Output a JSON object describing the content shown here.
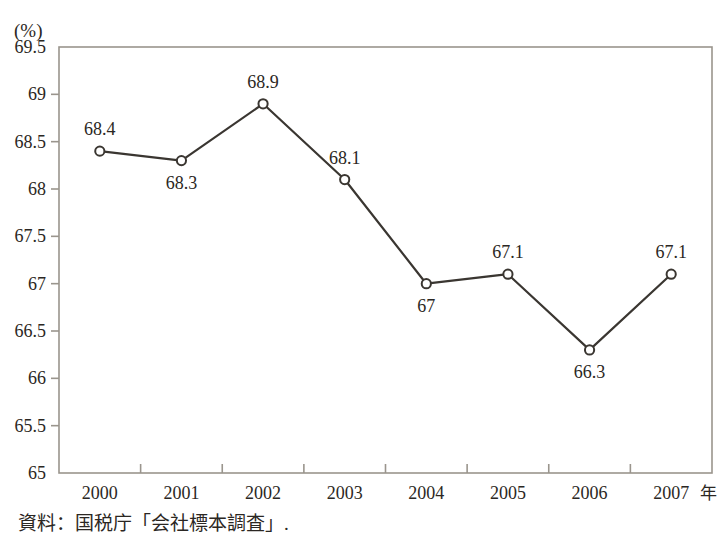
{
  "figure": {
    "unit_label": "(%)",
    "caption": "資料：国税庁「会社標本調査」.",
    "x_axis_unit": "年"
  },
  "chart_data": {
    "type": "line",
    "title": "",
    "xlabel": "",
    "ylabel": "(%)",
    "categories": [
      "2000",
      "2001",
      "2002",
      "2003",
      "2004",
      "2005",
      "2006",
      "2007"
    ],
    "values": [
      68.4,
      68.3,
      68.9,
      68.1,
      67.0,
      67.1,
      66.3,
      67.1
    ],
    "point_labels": [
      "68.4",
      "68.3",
      "68.9",
      "68.1",
      "67",
      "67.1",
      "66.3",
      "67.1"
    ],
    "label_positions": [
      "above",
      "below",
      "above",
      "above",
      "below",
      "above",
      "below",
      "above"
    ],
    "ylim": [
      65,
      69.5
    ],
    "yticks": [
      65,
      65.5,
      66,
      66.5,
      67,
      67.5,
      68,
      68.5,
      69,
      69.5
    ],
    "ytick_labels": [
      "65",
      "65.5",
      "66",
      "66.5",
      "67",
      "67.5",
      "68",
      "68.5",
      "69",
      "69.5"
    ],
    "grid": false,
    "legend": "none",
    "marker": "open-circle",
    "line_color": "#3a3631",
    "marker_fill": "#ffffff",
    "axis_color": "#9a958d",
    "source": "資料：国税庁「会社標本調査」."
  }
}
